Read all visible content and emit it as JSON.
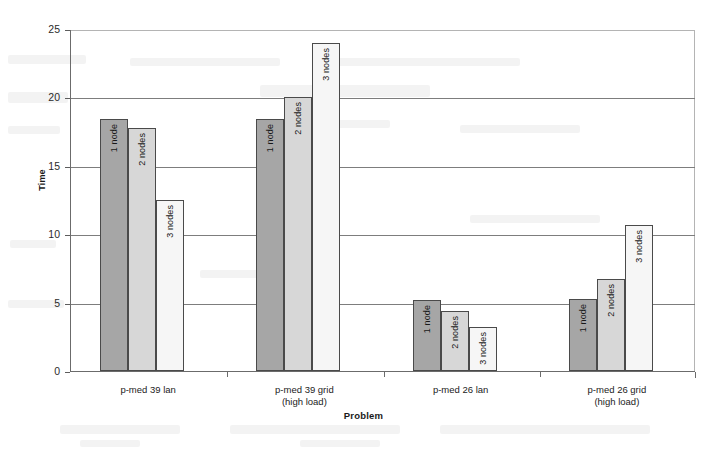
{
  "chart_data": {
    "type": "bar",
    "title": "",
    "subtitle": "",
    "xlabel": "Problem",
    "ylabel": "Time",
    "ylim": [
      0,
      25
    ],
    "yticks": [
      0,
      5,
      10,
      15,
      20,
      25
    ],
    "grid": true,
    "grid_axis": "y",
    "legend": "none (bars labelled in place)",
    "legend_position": "none",
    "categories": [
      "p-med 39 lan",
      "p-med 39 grid (high load)",
      "p-med 26 lan",
      "p-med 26 grid (high load)"
    ],
    "category_lines": [
      [
        "p-med 39 lan",
        ""
      ],
      [
        "p-med 39 grid",
        "(high load)"
      ],
      [
        "p-med 26 lan",
        ""
      ],
      [
        "p-med 26 grid",
        "(high load)"
      ]
    ],
    "series": [
      {
        "name": "1 node",
        "color": "#a6a6a6",
        "values": [
          18.4,
          18.4,
          5.2,
          5.3
        ]
      },
      {
        "name": "2 nodes",
        "color": "#d7d7d7",
        "values": [
          17.8,
          20.0,
          4.4,
          6.7
        ]
      },
      {
        "name": "3 nodes",
        "color": "#f6f6f6",
        "values": [
          12.5,
          24.0,
          3.2,
          10.7
        ]
      }
    ],
    "annotations": [
      "1 node",
      "2 nodes",
      "3 nodes",
      "1 node",
      "2 nodes",
      "3 nodes",
      "1 node",
      "2 nodes",
      "3 nodes",
      "1 node",
      "2 nodes",
      "3 nodes"
    ]
  },
  "axis": {
    "y_title": "Time",
    "x_title": "Problem",
    "y_tick_labels": [
      "25",
      "20",
      "15",
      "10",
      "5",
      "0"
    ]
  },
  "colors": {
    "series_1_node": "#a6a6a6",
    "series_2_nodes": "#d7d7d7",
    "series_3_nodes": "#f6f6f6",
    "bar_outline": "#4a4a4a",
    "axis": "#6b6b6b",
    "gridline": "#7d7d7d",
    "background": "#ffffff"
  }
}
